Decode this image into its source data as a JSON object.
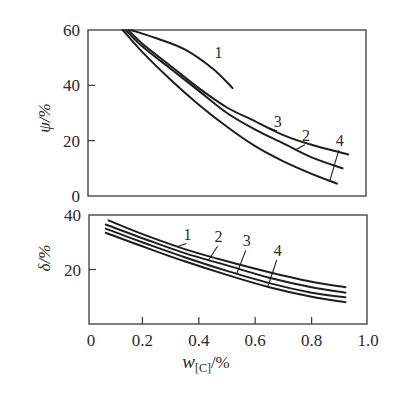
{
  "chart_data": [
    {
      "type": "line",
      "panel": "top",
      "title": "",
      "xlabel": "w_[C]/%",
      "ylabel": "ψ/%",
      "xlim": [
        0,
        1.0
      ],
      "ylim": [
        0,
        60
      ],
      "yticks": [
        0,
        20,
        40,
        60
      ],
      "ytick_labels": [
        "0",
        "20",
        "40",
        "60"
      ],
      "grid": false,
      "legend": "inline numeric labels",
      "series": [
        {
          "name": "1",
          "x": [
            0.16,
            0.25,
            0.35,
            0.45,
            0.52
          ],
          "y": [
            60,
            57,
            53,
            46,
            39
          ]
        },
        {
          "name": "2",
          "x": [
            0.14,
            0.2,
            0.3,
            0.4,
            0.5,
            0.6,
            0.7,
            0.8,
            0.91
          ],
          "y": [
            60,
            54,
            46,
            38,
            30,
            24,
            19,
            14,
            10
          ]
        },
        {
          "name": "3",
          "x": [
            0.15,
            0.2,
            0.3,
            0.4,
            0.5,
            0.6,
            0.7,
            0.8,
            0.93
          ],
          "y": [
            60,
            55,
            47,
            39,
            32,
            27,
            22,
            18.5,
            15
          ]
        },
        {
          "name": "4",
          "x": [
            0.13,
            0.2,
            0.3,
            0.4,
            0.5,
            0.6,
            0.7,
            0.8,
            0.89
          ],
          "y": [
            60,
            52,
            42,
            33,
            25,
            18,
            12.5,
            8,
            4.5
          ]
        }
      ],
      "annotations": [
        {
          "text": "1",
          "x": 0.47,
          "y": 50
        },
        {
          "text": "3",
          "x": 0.68,
          "y": 25
        },
        {
          "text": "2",
          "x": 0.78,
          "y": 20
        },
        {
          "text": "4",
          "x": 0.9,
          "y": 18
        }
      ]
    },
    {
      "type": "line",
      "panel": "bottom",
      "title": "",
      "xlabel": "w_[C]/%",
      "ylabel": "δ/%",
      "xlim": [
        0,
        1.0
      ],
      "ylim": [
        0,
        40
      ],
      "xticks": [
        0,
        0.2,
        0.4,
        0.6,
        0.8,
        1.0
      ],
      "xtick_labels": [
        "0",
        "0.2",
        "0.4",
        "0.6",
        "0.8",
        "1.0"
      ],
      "yticks": [
        20,
        40
      ],
      "ytick_labels": [
        "20",
        "40"
      ],
      "grid": false,
      "legend": "inline numeric labels",
      "series": [
        {
          "name": "1",
          "x": [
            0.08,
            0.2,
            0.35,
            0.5,
            0.65,
            0.8,
            0.92
          ],
          "y": [
            38,
            33,
            27.5,
            23,
            19,
            15.5,
            13.5
          ]
        },
        {
          "name": "2",
          "x": [
            0.07,
            0.2,
            0.35,
            0.5,
            0.65,
            0.8,
            0.92
          ],
          "y": [
            36.5,
            31.5,
            26,
            21.5,
            17,
            13.5,
            11.5
          ]
        },
        {
          "name": "3",
          "x": [
            0.07,
            0.2,
            0.35,
            0.5,
            0.65,
            0.8,
            0.92
          ],
          "y": [
            35,
            30,
            24.5,
            19.5,
            15,
            11.5,
            9.8
          ]
        },
        {
          "name": "4",
          "x": [
            0.07,
            0.2,
            0.35,
            0.5,
            0.65,
            0.8,
            0.92
          ],
          "y": [
            33.5,
            28.5,
            23,
            18,
            13.5,
            10,
            8
          ]
        }
      ],
      "annotations": [
        {
          "text": "1",
          "x": 0.36,
          "y": 31
        },
        {
          "text": "2",
          "x": 0.47,
          "y": 30
        },
        {
          "text": "3",
          "x": 0.57,
          "y": 28.5
        },
        {
          "text": "4",
          "x": 0.68,
          "y": 25
        }
      ]
    }
  ],
  "labels": {
    "top_ylabel": "ψ/%",
    "bottom_ylabel": "δ/%",
    "xlabel_main": "w",
    "xlabel_sub": "[C]",
    "xlabel_unit": "/%"
  }
}
